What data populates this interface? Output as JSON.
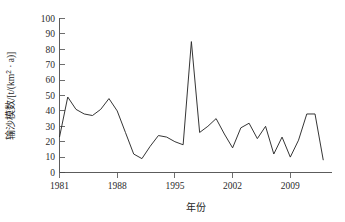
{
  "chart_data": {
    "type": "line",
    "title": "",
    "xlabel": "年份",
    "ylabel": "输沙模数/[t/(km² · a)]",
    "ylabel_parts": {
      "name": "输沙模数",
      "unit_prefix": "/[t/(km",
      "unit_sup": "2",
      "unit_suffix": " · a)]"
    },
    "xlim": [
      1981,
      2013
    ],
    "ylim": [
      0,
      100
    ],
    "grid": false,
    "legend": null,
    "x_ticks": [
      "1981",
      "1988",
      "1995",
      "2002",
      "2009"
    ],
    "x_tick_values": [
      1981,
      1988,
      1995,
      2002,
      2009
    ],
    "y_ticks": [
      "0",
      "10",
      "20",
      "30",
      "40",
      "50",
      "60",
      "70",
      "80",
      "90",
      "100"
    ],
    "y_tick_values": [
      0,
      10,
      20,
      30,
      40,
      50,
      60,
      70,
      80,
      90,
      100
    ],
    "x": [
      1981,
      1982,
      1983,
      1984,
      1985,
      1986,
      1987,
      1988,
      1989,
      1990,
      1991,
      1992,
      1993,
      1994,
      1995,
      1996,
      1997,
      1998,
      1999,
      2000,
      2001,
      2002,
      2003,
      2004,
      2005,
      2006,
      2007,
      2008,
      2009,
      2010,
      2011,
      2012,
      2013
    ],
    "values": [
      23,
      49,
      41,
      38,
      37,
      41,
      48,
      40,
      26,
      12,
      9,
      17,
      24,
      23,
      20,
      18,
      85,
      26,
      30,
      35,
      25,
      16,
      29,
      32,
      22,
      30,
      12,
      23,
      10,
      21,
      38,
      38,
      8
    ],
    "series": [
      {
        "name": "输沙模数",
        "color": "#2a2a2a",
        "values": [
          23,
          49,
          41,
          38,
          37,
          41,
          48,
          40,
          26,
          12,
          9,
          17,
          24,
          23,
          20,
          18,
          85,
          26,
          30,
          35,
          25,
          16,
          29,
          32,
          22,
          30,
          12,
          23,
          10,
          21,
          38,
          38,
          8
        ]
      }
    ],
    "peak": {
      "x": 1997,
      "y": 85
    },
    "colors": {
      "line": "#2a2a2a",
      "axis": "#4a4a4a",
      "text": "#1f1f1f",
      "background": "#ffffff"
    }
  }
}
